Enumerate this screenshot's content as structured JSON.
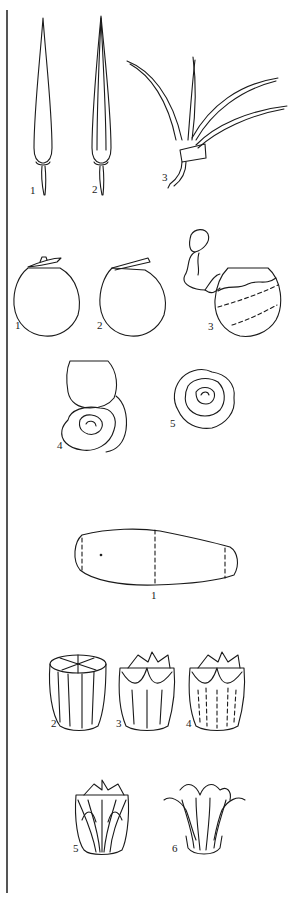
{
  "figure": {
    "panels": [
      {
        "name": "chili-flower",
        "steps": [
          {
            "label": "1",
            "desc": "whole chili"
          },
          {
            "label": "2",
            "desc": "chili slit lengthwise"
          },
          {
            "label": "3",
            "desc": "chili cut into fanned strips"
          }
        ]
      },
      {
        "name": "tomato-rose",
        "steps": [
          {
            "label": "1",
            "desc": "tomato with top cap removed"
          },
          {
            "label": "2",
            "desc": "peel begun from top"
          },
          {
            "label": "3",
            "desc": "peeling skin in continuous spiral strip"
          },
          {
            "label": "4",
            "desc": "rolling peel into rose"
          },
          {
            "label": "5",
            "desc": "finished rose"
          }
        ]
      },
      {
        "name": "vegetable-lotus",
        "steps": [
          {
            "label": "1",
            "desc": "vegetable marked for cutting"
          },
          {
            "label": "2",
            "desc": "cut segment with top scored"
          },
          {
            "label": "3",
            "desc": "petals outlined"
          },
          {
            "label": "4",
            "desc": "inner petals marked"
          },
          {
            "label": "5",
            "desc": "petals carved"
          },
          {
            "label": "6",
            "desc": "finished lotus opened"
          }
        ]
      }
    ]
  }
}
